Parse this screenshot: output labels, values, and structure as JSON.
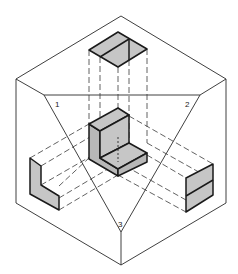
{
  "figure": {
    "plane_labels": [
      {
        "id": "1",
        "text": "1"
      },
      {
        "id": "2",
        "text": "2"
      },
      {
        "id": "3",
        "text": "3"
      }
    ],
    "colors": {
      "line": "#1a1a1a",
      "shade": "#c6c6c6",
      "background": "#ffffff"
    }
  }
}
